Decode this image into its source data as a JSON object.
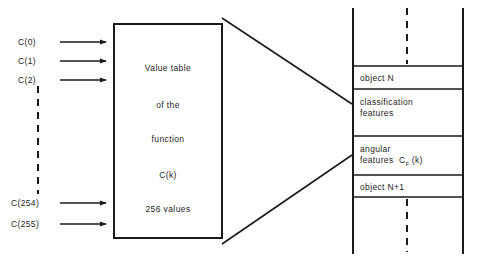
{
  "figure": {
    "ink_color": "#1a1a1a",
    "background": "#ffffff"
  },
  "inputs": {
    "description": "Indexed coefficient inputs feeding the value table",
    "labels": [
      {
        "text": "C(0)",
        "y": 38
      },
      {
        "text": "C(1)",
        "y": 57
      },
      {
        "text": "C(2)",
        "y": 76
      },
      {
        "text": "C(254)",
        "y": 199
      },
      {
        "text": "C(255)",
        "y": 220
      }
    ],
    "ellipsis_note": "vertical dashed line indicating omitted entries C(3) .. C(253)"
  },
  "value_box": {
    "lines": [
      "Value table",
      "of the",
      "function",
      "C(k)",
      "256 values"
    ]
  },
  "record_panel": {
    "rows": [
      {
        "label": "object N",
        "line2": ""
      },
      {
        "label": "classification",
        "line2": "features"
      },
      {
        "label": "angular",
        "line2": "features",
        "symbol": "C",
        "subscript": "F",
        "argument": "(k)"
      },
      {
        "label": "object N+1",
        "line2": ""
      }
    ],
    "ellipsis_note": "vertical dashed lines above and below indicating continuation of the record stream"
  }
}
